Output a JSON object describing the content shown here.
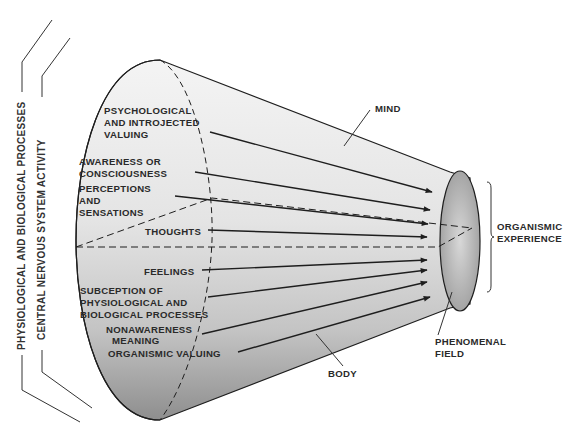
{
  "diagram": {
    "left_brackets": {
      "outer_label": "PHYSIOLOGICAL AND BIOLOGICAL PROCESSES",
      "inner_label": "CENTRAL NERVOUS SYSTEM ACTIVITY"
    },
    "cone_labels": {
      "psych_1": "PSYCHOLOGICAL",
      "psych_2": "AND INTROJECTED",
      "psych_3": "VALUING",
      "aware_1": "AWARENESS OR",
      "aware_2": "CONSCIOUSNESS",
      "percep_1": "PERCEPTIONS",
      "percep_2": "AND",
      "percep_3": "SENSATIONS",
      "thoughts": "THOUGHTS",
      "feelings": "FEELINGS",
      "subcep_1": "SUBCEPTION OF",
      "subcep_2": "PHYSIOLOGICAL AND",
      "subcep_3": "BIOLOGICAL PROCESSES",
      "nonaware_1": "NONAWARENESS",
      "nonaware_2": "MEANING",
      "organismic_valuing": "ORGANISMIC VALUING"
    },
    "callouts": {
      "mind": "MIND",
      "body": "BODY",
      "phenomenal_1": "PHENOMENAL",
      "phenomenal_2": "FIELD",
      "organismic_1": "ORGANISMIC",
      "organismic_2": "EXPERIENCE"
    },
    "colors": {
      "cone_light": "#f2f2f2",
      "cone_dark": "#8a8a8a",
      "line": "#1e1e1e",
      "text": "#2a2a2a"
    }
  }
}
